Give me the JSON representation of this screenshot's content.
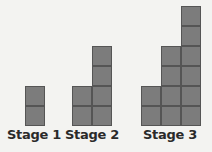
{
  "figure": {
    "type": "growing pattern of squares",
    "square_size_px": 20,
    "baseline_y": 126,
    "colors": {
      "background": "#f3f3f1",
      "square_fill": "#7c7c7c",
      "square_border": "#555555",
      "label_text": "#2a2a2a"
    },
    "stages": [
      {
        "label": "Stage 1",
        "columns": [
          {
            "x": 25,
            "height": 2
          }
        ],
        "label_center_x": 34
      },
      {
        "label": "Stage 2",
        "columns": [
          {
            "x": 72,
            "height": 2
          },
          {
            "x": 92,
            "height": 4
          }
        ],
        "label_center_x": 92
      },
      {
        "label": "Stage 3",
        "columns": [
          {
            "x": 141,
            "height": 2
          },
          {
            "x": 161,
            "height": 4
          },
          {
            "x": 181,
            "height": 6
          }
        ],
        "label_center_x": 170
      }
    ]
  }
}
